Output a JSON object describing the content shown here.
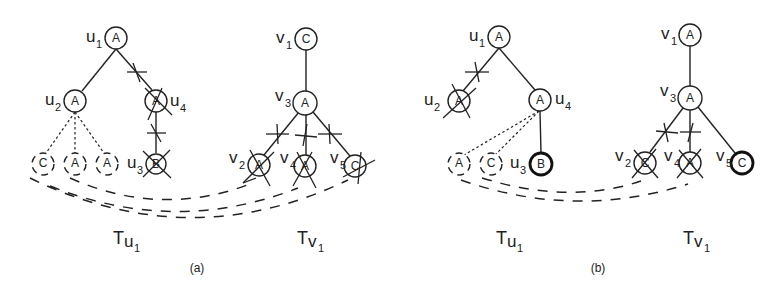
{
  "panels": [
    {
      "caption": "(a)",
      "tree_u": {
        "title": "T",
        "title_sub": "u",
        "title_subsub": "1",
        "nodes": {
          "u1": {
            "name": "u",
            "sub": "1",
            "label": "A"
          },
          "u2": {
            "name": "u",
            "sub": "2",
            "label": "A"
          },
          "u4": {
            "name": "u",
            "sub": "4",
            "label": "A",
            "crossed": true
          },
          "u3": {
            "name": "u",
            "sub": "3",
            "label": "B",
            "crossed": true
          },
          "leaf1": {
            "label": "C",
            "dashed": true
          },
          "leaf2": {
            "label": "A",
            "dashed": true
          },
          "leaf3": {
            "label": "A",
            "dashed": true
          }
        }
      },
      "tree_v": {
        "title": "T",
        "title_sub": "v",
        "title_subsub": "1",
        "nodes": {
          "v1": {
            "name": "v",
            "sub": "1",
            "label": "C"
          },
          "v3": {
            "name": "v",
            "sub": "3",
            "label": "A"
          },
          "v2": {
            "name": "v",
            "sub": "2",
            "label": "A",
            "crossed": true
          },
          "v4": {
            "name": "v",
            "sub": "4",
            "label": "A",
            "crossed": true
          },
          "v5": {
            "name": "v",
            "sub": "5",
            "label": "C",
            "crossed": true
          }
        }
      }
    },
    {
      "caption": "(b)",
      "tree_u": {
        "title": "T",
        "title_sub": "u",
        "title_subsub": "1",
        "nodes": {
          "u1": {
            "name": "u",
            "sub": "1",
            "label": "A"
          },
          "u2": {
            "name": "u",
            "sub": "2",
            "label": "A",
            "crossed": true
          },
          "u4": {
            "name": "u",
            "sub": "4",
            "label": "A"
          },
          "u3": {
            "name": "u",
            "sub": "3",
            "label": "B",
            "bold": true
          },
          "leaf1": {
            "label": "A",
            "dashed": true
          },
          "leaf2": {
            "label": "C",
            "dashed": true
          }
        }
      },
      "tree_v": {
        "title": "T",
        "title_sub": "v",
        "title_subsub": "1",
        "nodes": {
          "v1": {
            "name": "v",
            "sub": "1",
            "label": "A"
          },
          "v3": {
            "name": "v",
            "sub": "3",
            "label": "A"
          },
          "v2": {
            "name": "v",
            "sub": "2",
            "label": "C",
            "crossed": true
          },
          "v4": {
            "name": "v",
            "sub": "4",
            "label": "A",
            "crossed": true
          },
          "v5": {
            "name": "v",
            "sub": "5",
            "label": "C",
            "bold": true
          }
        }
      }
    }
  ]
}
